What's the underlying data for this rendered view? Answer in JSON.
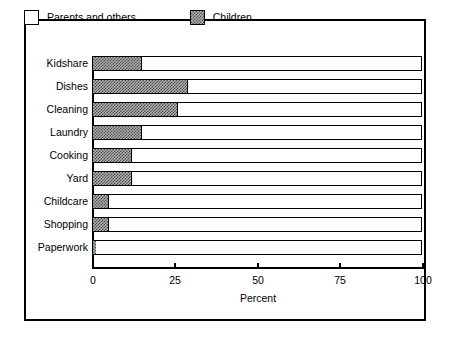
{
  "chart_data": {
    "type": "bar",
    "orientation": "horizontal",
    "stacked": true,
    "title": "",
    "xlabel": "Percent",
    "ylabel": "",
    "xlim": [
      0,
      100
    ],
    "xticks": [
      0,
      25,
      50,
      75,
      100
    ],
    "xtick_labels": [
      "0",
      "25",
      "50",
      "75",
      "100"
    ],
    "grid": false,
    "legend_position": "top",
    "categories": [
      "Kidshare",
      "Dishes",
      "Cleaning",
      "Laundry",
      "Cooking",
      "Yard",
      "Childcare",
      "Shopping",
      "Paperwork"
    ],
    "series": [
      {
        "name": "Children",
        "fill": "dark-checker-hatch",
        "values": [
          15,
          29,
          26,
          15,
          12,
          12,
          5,
          5,
          1
        ]
      },
      {
        "name": "Parents and others",
        "fill": "white",
        "values": [
          85,
          71,
          74,
          85,
          88,
          88,
          95,
          95,
          99
        ]
      }
    ]
  },
  "legend": {
    "entries": [
      {
        "label": "Parents and others",
        "swatch": "white-square"
      },
      {
        "label": "Children",
        "swatch": "checker-square"
      }
    ]
  },
  "axis": {
    "x_title": "Percent",
    "tick_labels": [
      "0",
      "25",
      "50",
      "75",
      "100"
    ],
    "tick_values": [
      0,
      25,
      50,
      75,
      100
    ]
  },
  "colors": {
    "frame": "#000000",
    "bar_outline": "#000000",
    "children_fill": "#4a4a4a",
    "parents_fill": "#ffffff",
    "background": "#ffffff"
  }
}
